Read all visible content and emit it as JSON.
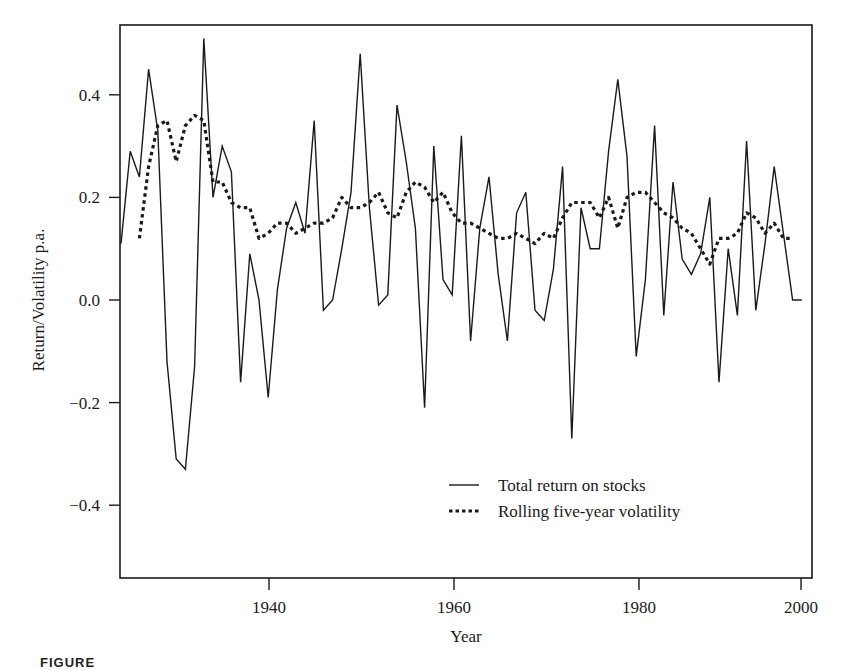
{
  "figure": {
    "caption": "FIGURE"
  },
  "chart_data": {
    "type": "line",
    "title": "",
    "xlabel": "Year",
    "ylabel": "Return/Volatility p.a.",
    "xlim": [
      1925,
      2001
    ],
    "ylim": [
      -0.54,
      0.54
    ],
    "x_ticks": [
      1940,
      1960,
      1980,
      2000
    ],
    "x_tick_labels": [
      "1940",
      "1960",
      "1980",
      "2000"
    ],
    "y_ticks": [
      0.4,
      0.2,
      0.0,
      -0.2,
      -0.4
    ],
    "y_tick_labels": [
      "0.4",
      "0.2",
      "0.0",
      "−0.2",
      "−0.4"
    ],
    "grid": false,
    "legend_position": "lower right (inside plot)",
    "series": [
      {
        "name": "Total return on stocks",
        "style": "solid",
        "x": [
          1925,
          1926,
          1927,
          1928,
          1929,
          1930,
          1931,
          1932,
          1933,
          1934,
          1935,
          1936,
          1937,
          1938,
          1939,
          1940,
          1941,
          1942,
          1943,
          1944,
          1945,
          1946,
          1947,
          1948,
          1949,
          1950,
          1951,
          1952,
          1953,
          1954,
          1955,
          1956,
          1957,
          1958,
          1959,
          1960,
          1961,
          1962,
          1963,
          1964,
          1965,
          1966,
          1967,
          1968,
          1969,
          1970,
          1971,
          1972,
          1973,
          1974,
          1975,
          1976,
          1977,
          1978,
          1979,
          1980,
          1981,
          1982,
          1983,
          1984,
          1985,
          1986,
          1987,
          1988,
          1989,
          1990,
          1991,
          1992,
          1993,
          1994,
          1995,
          1996,
          1997,
          1998,
          1999
        ],
        "values": [
          0.11,
          0.29,
          0.24,
          0.45,
          0.33,
          -0.12,
          -0.31,
          -0.33,
          -0.13,
          0.51,
          0.2,
          0.3,
          0.25,
          -0.16,
          0.09,
          0.0,
          -0.19,
          0.02,
          0.14,
          0.19,
          0.13,
          0.35,
          -0.02,
          0.0,
          0.1,
          0.21,
          0.48,
          0.18,
          -0.01,
          0.01,
          0.38,
          0.27,
          0.14,
          -0.21,
          0.3,
          0.04,
          0.01,
          0.32,
          -0.08,
          0.14,
          0.24,
          0.05,
          -0.08,
          0.17,
          0.21,
          -0.02,
          -0.04,
          0.06,
          0.26,
          -0.27,
          0.18,
          0.1,
          0.1,
          0.29,
          0.43,
          0.28,
          -0.11,
          0.04,
          0.34,
          -0.03,
          0.23,
          0.08,
          0.05,
          0.09,
          0.2,
          -0.16,
          0.1,
          -0.03,
          0.31,
          -0.02,
          0.11,
          0.26,
          0.13,
          0.0,
          0.0
        ]
      },
      {
        "name": "Rolling five-year volatility",
        "style": "dotted",
        "x": [
          1927,
          1928,
          1929,
          1930,
          1931,
          1932,
          1933,
          1934,
          1935,
          1936,
          1937,
          1938,
          1939,
          1940,
          1941,
          1942,
          1943,
          1944,
          1945,
          1946,
          1947,
          1948,
          1949,
          1950,
          1951,
          1952,
          1953,
          1954,
          1955,
          1956,
          1957,
          1958,
          1959,
          1960,
          1961,
          1962,
          1963,
          1964,
          1965,
          1966,
          1967,
          1968,
          1969,
          1970,
          1971,
          1972,
          1973,
          1974,
          1975,
          1976,
          1977,
          1978,
          1979,
          1980,
          1981,
          1982,
          1983,
          1984,
          1985,
          1986,
          1987,
          1988,
          1989,
          1990,
          1991,
          1992,
          1993,
          1994,
          1995,
          1996,
          1997,
          1998
        ],
        "values": [
          0.12,
          0.26,
          0.34,
          0.35,
          0.27,
          0.34,
          0.36,
          0.35,
          0.23,
          0.23,
          0.19,
          0.18,
          0.18,
          0.12,
          0.13,
          0.15,
          0.15,
          0.13,
          0.14,
          0.15,
          0.15,
          0.16,
          0.2,
          0.18,
          0.18,
          0.19,
          0.21,
          0.17,
          0.16,
          0.21,
          0.23,
          0.22,
          0.19,
          0.21,
          0.17,
          0.15,
          0.15,
          0.14,
          0.13,
          0.12,
          0.12,
          0.13,
          0.12,
          0.11,
          0.13,
          0.12,
          0.16,
          0.19,
          0.19,
          0.19,
          0.16,
          0.2,
          0.14,
          0.2,
          0.21,
          0.21,
          0.19,
          0.17,
          0.16,
          0.14,
          0.13,
          0.1,
          0.07,
          0.12,
          0.12,
          0.13,
          0.17,
          0.16,
          0.13,
          0.15,
          0.12,
          0.12
        ]
      }
    ]
  },
  "legend": {
    "items": [
      {
        "label": "Total return on stocks",
        "style": "solid"
      },
      {
        "label": "Rolling five-year volatility",
        "style": "dotted"
      }
    ]
  }
}
